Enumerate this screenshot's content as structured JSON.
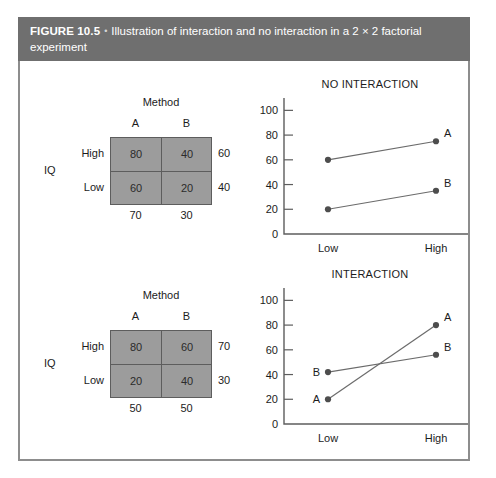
{
  "figure": {
    "label": "FIGURE 10.5",
    "bullet": "•",
    "caption": "Illustration of interaction and no interaction in a 2 × 2 factorial experiment"
  },
  "matrices": [
    {
      "name": "no-interaction-matrix",
      "column_factor": "Method",
      "row_factor": "IQ",
      "columns": [
        "A",
        "B"
      ],
      "rows": [
        "High",
        "Low"
      ],
      "cells": [
        [
          "80",
          "40"
        ],
        [
          "60",
          "20"
        ]
      ],
      "row_means": [
        "60",
        "40"
      ],
      "col_means": [
        "70",
        "30"
      ]
    },
    {
      "name": "interaction-matrix",
      "column_factor": "Method",
      "row_factor": "IQ",
      "columns": [
        "A",
        "B"
      ],
      "rows": [
        "High",
        "Low"
      ],
      "cells": [
        [
          "80",
          "60"
        ],
        [
          "20",
          "40"
        ]
      ],
      "row_means": [
        "70",
        "30"
      ],
      "col_means": [
        "50",
        "50"
      ]
    }
  ],
  "charts": [
    {
      "name": "no-interaction-chart",
      "title": "NO INTERACTION",
      "y_ticks": [
        "0",
        "20",
        "40",
        "60",
        "80",
        "100"
      ],
      "x_ticks": [
        "Low",
        "High"
      ],
      "series": [
        {
          "label": "A",
          "low": "60",
          "high": "75"
        },
        {
          "label": "B",
          "low": "20",
          "high": "35"
        }
      ]
    },
    {
      "name": "interaction-chart",
      "title": "INTERACTION",
      "y_ticks": [
        "0",
        "20",
        "40",
        "60",
        "80",
        "100"
      ],
      "x_ticks": [
        "Low",
        "High"
      ],
      "series": [
        {
          "label": "A",
          "low": "20",
          "high": "80"
        },
        {
          "label": "B",
          "low": "42",
          "high": "56"
        }
      ]
    }
  ],
  "chart_data": [
    {
      "type": "line",
      "title": "NO INTERACTION",
      "xlabel": "",
      "ylabel": "",
      "categories": [
        "Low",
        "High"
      ],
      "ylim": [
        0,
        110
      ],
      "yticks": [
        0,
        20,
        40,
        60,
        80,
        100
      ],
      "grid": false,
      "legend": "point-labels",
      "series": [
        {
          "name": "A",
          "values": [
            60,
            75
          ]
        },
        {
          "name": "B",
          "values": [
            20,
            35
          ]
        }
      ]
    },
    {
      "type": "line",
      "title": "INTERACTION",
      "xlabel": "",
      "ylabel": "",
      "categories": [
        "Low",
        "High"
      ],
      "ylim": [
        0,
        110
      ],
      "yticks": [
        0,
        20,
        40,
        60,
        80,
        100
      ],
      "grid": false,
      "legend": "point-labels",
      "series": [
        {
          "name": "A",
          "values": [
            20,
            80
          ]
        },
        {
          "name": "B",
          "values": [
            42,
            56
          ]
        }
      ]
    },
    {
      "type": "table",
      "title": "No interaction cell means (IQ × Method)",
      "columns": [
        "",
        "A",
        "B",
        "Row mean"
      ],
      "rows": [
        [
          "High",
          80,
          40,
          60
        ],
        [
          "Low",
          60,
          20,
          40
        ],
        [
          "Column mean",
          70,
          30,
          ""
        ]
      ]
    },
    {
      "type": "table",
      "title": "Interaction cell means (IQ × Method)",
      "columns": [
        "",
        "A",
        "B",
        "Row mean"
      ],
      "rows": [
        [
          "High",
          80,
          60,
          70
        ],
        [
          "Low",
          20,
          40,
          30
        ],
        [
          "Column mean",
          50,
          50,
          ""
        ]
      ]
    }
  ]
}
